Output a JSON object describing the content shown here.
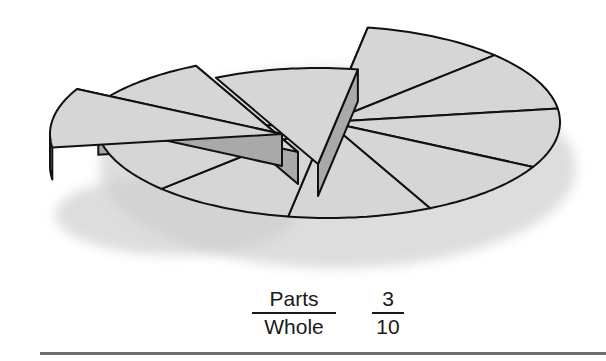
{
  "figure": {
    "type": "exploded-3d-pie",
    "total_slices": 10,
    "separated_slices": 3,
    "colors": {
      "top": "#d6d6d6",
      "side": "#a9a9a9",
      "outline": "#111111",
      "shadow": "#cfcfcf"
    }
  },
  "fraction_words": {
    "numerator": "Parts",
    "denominator": "Whole"
  },
  "fraction_numbers": {
    "numerator": "3",
    "denominator": "10"
  }
}
